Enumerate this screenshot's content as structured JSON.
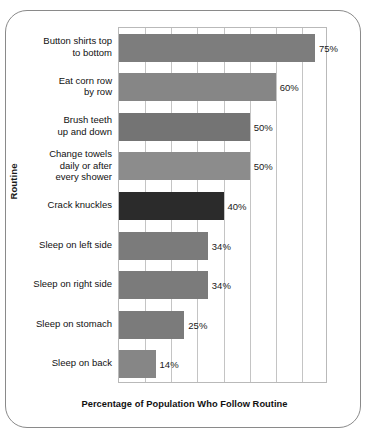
{
  "chart_data": {
    "type": "bar",
    "orientation": "horizontal",
    "title": "",
    "xlabel": "Percentage of Population Who Follow Routine",
    "ylabel": "Routine",
    "xlim": [
      0,
      80
    ],
    "grid": true,
    "grid_axis": "x",
    "gridline_interval": 10,
    "legend": "none",
    "categories": [
      "Button shirts top\nto bottom",
      "Eat corn row\nby row",
      "Brush teeth\nup and down",
      "Change towels\ndaily or after\nevery shower",
      "Crack knuckles",
      "Sleep on left side",
      "Sleep on right side",
      "Sleep on stomach",
      "Sleep on back"
    ],
    "values": [
      75,
      60,
      50,
      50,
      40,
      34,
      34,
      25,
      14
    ],
    "value_labels": [
      "75%",
      "60%",
      "50%",
      "50%",
      "40%",
      "34%",
      "34%",
      "25%",
      "14%"
    ],
    "bar_colors": [
      "#7d7d7d",
      "#868686",
      "#747474",
      "#8c8c8c",
      "#2b2b2b",
      "#7b7b7b",
      "#7b7b7b",
      "#7b7b7b",
      "#868686"
    ],
    "highlight_category": "Crack knuckles",
    "highlight_color": "#2b2b2b"
  },
  "frame": {
    "border_color": "#8a8a8a",
    "background": "#ffffff"
  }
}
